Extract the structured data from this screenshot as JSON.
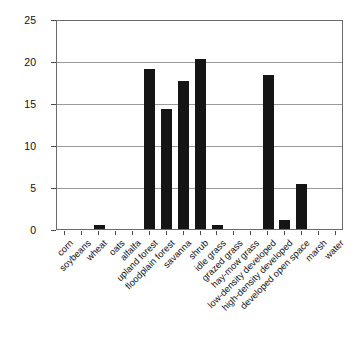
{
  "chart_data": {
    "type": "bar",
    "title": "",
    "subtitle": "",
    "xlabel": "",
    "ylabel": "Northern Cardinals/100 acres",
    "ylim": [
      0,
      25
    ],
    "yticks": [
      0,
      5,
      10,
      15,
      20,
      25
    ],
    "grid": true,
    "legend": "none",
    "bar_color": "#151515",
    "categories": [
      "corn",
      "soybeans",
      "wheat",
      "oats",
      "alfalfa",
      "upland forest",
      "floodplain forest",
      "savanna",
      "shrub",
      "idle grass",
      "grazed grass",
      "hay-mow grass",
      "low-density developed",
      "high-density developed",
      "developed open space",
      "marsh",
      "water"
    ],
    "values": [
      0,
      0,
      0.5,
      0,
      0,
      19.1,
      14.3,
      17.6,
      20.2,
      0.45,
      0,
      0,
      18.3,
      1.1,
      5.4,
      0,
      0
    ]
  },
  "axes": {
    "y_tick_labels": [
      "25",
      "20",
      "15",
      "10",
      "5",
      "0"
    ]
  }
}
